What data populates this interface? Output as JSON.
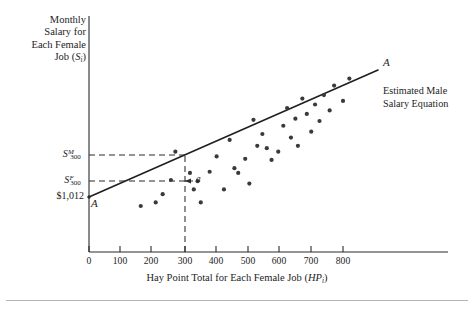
{
  "figure": {
    "caption_rule": true
  },
  "axes": {
    "y_title_lines": [
      "Monthly",
      "Salary for",
      "Each Female",
      "Job ("
    ],
    "y_title_symbol": "S",
    "y_title_subscript": "i",
    "y_title_close": ")",
    "x_title_text": "Hay Point Total for Each Female Job (",
    "x_title_symbol": "HP",
    "x_title_subscript": "i",
    "x_title_close": ")",
    "x_ticks": [
      0,
      100,
      200,
      300,
      400,
      500,
      600,
      700,
      800
    ],
    "x_range": [
      0,
      900
    ],
    "y_range": [
      0,
      100
    ]
  },
  "markers": {
    "male_salary_base": "S",
    "male_salary_sup": "M",
    "male_salary_sub": "300",
    "female_salary_base": "S",
    "female_salary_sup": "F",
    "female_salary_sub": "300",
    "intercept_value": "$1,012",
    "gap_label": "a",
    "line_label_right": "A",
    "line_label_left": "A",
    "legend_line1": "Estimated Male",
    "legend_line2": "Salary Equation"
  },
  "chart_data": {
    "type": "scatter",
    "title": "",
    "xlabel": "Hay Point Total for Each Female Job (HPi)",
    "ylabel": "Monthly Salary for Each Female Job (Si)",
    "xlim": [
      0,
      900
    ],
    "ylim": [
      0,
      100
    ],
    "grid": false,
    "legend_position": "right",
    "xtick_labels": [
      "0",
      "100",
      "200",
      "300",
      "400",
      "500",
      "600",
      "700",
      "800"
    ],
    "ytick_labels": [
      "$1,012",
      "S(F,300)",
      "S(M,300)"
    ],
    "annotations": [
      {
        "text": "A",
        "x": 890,
        "y": 79,
        "role": "line-end-label"
      },
      {
        "text": "A",
        "x": 18,
        "y": 20,
        "role": "line-start-label"
      },
      {
        "text": "a",
        "x": 330,
        "y": 31,
        "role": "gap-between-male-and-female-salary"
      },
      {
        "text": "Estimated Male Salary Equation",
        "x": 890,
        "y": 64,
        "role": "legend"
      }
    ],
    "reference_lines": [
      {
        "name": "estimated-male-salary-line",
        "kind": "solid",
        "x0": 0,
        "y0": 21.5,
        "x1": 845,
        "y1": 78.0,
        "description": "Estimated male salary equation A-A, intercept $1,012"
      },
      {
        "name": "male-salary-at-300-horizontal",
        "kind": "dashed",
        "x0": 0,
        "y0": 42.5,
        "x1": 300,
        "y1": 42.5
      },
      {
        "name": "female-salary-at-300-horizontal",
        "kind": "dashed",
        "x0": 0,
        "y0": 30.5,
        "x1": 300,
        "y1": 30.5
      },
      {
        "name": "hay-point-300-vertical",
        "kind": "dashed",
        "x0": 300,
        "y0": 0,
        "x1": 300,
        "y1": 42.5
      }
    ],
    "series": [
      {
        "name": "Female jobs",
        "marker": "filled-circle",
        "color": "#3a3a3a",
        "points": [
          [
            163,
            19.5
          ],
          [
            210,
            21.0
          ],
          [
            232,
            24.5
          ],
          [
            258,
            30.5
          ],
          [
            272,
            42.5
          ],
          [
            318,
            33.5
          ],
          [
            330,
            26.5
          ],
          [
            342,
            30.0
          ],
          [
            352,
            21.0
          ],
          [
            380,
            34.0
          ],
          [
            402,
            40.5
          ],
          [
            425,
            26.5
          ],
          [
            443,
            47.5
          ],
          [
            458,
            35.5
          ],
          [
            470,
            33.5
          ],
          [
            492,
            39.5
          ],
          [
            505,
            29.0
          ],
          [
            518,
            56.0
          ],
          [
            530,
            45.0
          ],
          [
            546,
            50.0
          ],
          [
            560,
            44.0
          ],
          [
            575,
            39.0
          ],
          [
            596,
            42.5
          ],
          [
            612,
            53.5
          ],
          [
            624,
            61.0
          ],
          [
            636,
            48.5
          ],
          [
            650,
            56.5
          ],
          [
            658,
            45.0
          ],
          [
            672,
            65.0
          ],
          [
            686,
            58.5
          ],
          [
            700,
            51.0
          ],
          [
            712,
            62.5
          ],
          [
            726,
            55.5
          ],
          [
            740,
            66.5
          ],
          [
            758,
            60.0
          ],
          [
            772,
            70.5
          ],
          [
            800,
            64.0
          ],
          [
            820,
            73.5
          ]
        ]
      }
    ]
  }
}
